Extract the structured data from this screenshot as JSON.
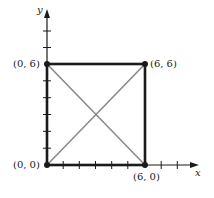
{
  "figure": {
    "axes": {
      "x_label": "x",
      "y_label": "y"
    },
    "points": [
      {
        "label": "(0, 0)",
        "x": 0,
        "y": 0
      },
      {
        "label": "(0, 6)",
        "x": 0,
        "y": 6
      },
      {
        "label": "(6, 6)",
        "x": 6,
        "y": 6
      },
      {
        "label": "(6, 0)",
        "x": 6,
        "y": 0
      }
    ],
    "colors": {
      "square": "#1a1a1a",
      "diagonals": "#8a8a8a",
      "axes": "#1a1a1a"
    }
  }
}
